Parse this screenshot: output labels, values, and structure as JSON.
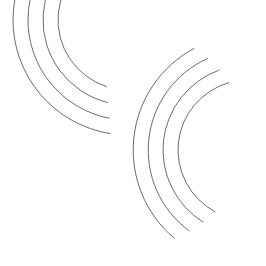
{
  "figure": {
    "width": 266,
    "height": 266,
    "background_color": "#ffffff",
    "stroke_color": "#5a5a5a",
    "stroke_width": 0.9
  },
  "chart_data": {
    "type": "line",
    "subtitle": "",
    "xlabel": "",
    "ylabel": "",
    "xlim": [
      0,
      266
    ],
    "ylim": [
      0,
      266
    ],
    "grid": false,
    "legend": "none",
    "annotations": [],
    "series": [
      {
        "name": "upper-left-arc-1",
        "family": "upper-left",
        "center": [
          128,
          20
        ],
        "radius": 70,
        "start_angle_deg": 108,
        "end_angle_deg": 262,
        "sweep": "clockwise"
      },
      {
        "name": "upper-left-arc-2",
        "family": "upper-left",
        "center": [
          128,
          20
        ],
        "radius": 85,
        "start_angle_deg": 104,
        "end_angle_deg": 262,
        "sweep": "clockwise"
      },
      {
        "name": "upper-left-arc-3",
        "family": "upper-left",
        "center": [
          128,
          20
        ],
        "radius": 100,
        "start_angle_deg": 101,
        "end_angle_deg": 262,
        "sweep": "clockwise"
      },
      {
        "name": "upper-left-arc-4",
        "family": "upper-left",
        "center": [
          128,
          20
        ],
        "radius": 115,
        "start_angle_deg": 99,
        "end_angle_deg": 262,
        "sweep": "clockwise"
      },
      {
        "name": "lower-right-arc-1",
        "family": "lower-right",
        "center": [
          248,
          150
        ],
        "radius": 70,
        "start_angle_deg": 118,
        "end_angle_deg": 254,
        "sweep": "clockwise"
      },
      {
        "name": "lower-right-arc-2",
        "family": "lower-right",
        "center": [
          248,
          150
        ],
        "radius": 85,
        "start_angle_deg": 122,
        "end_angle_deg": 250,
        "sweep": "clockwise"
      },
      {
        "name": "lower-right-arc-3",
        "family": "lower-right",
        "center": [
          248,
          150
        ],
        "radius": 100,
        "start_angle_deg": 126,
        "end_angle_deg": 246,
        "sweep": "clockwise"
      },
      {
        "name": "lower-right-arc-4",
        "family": "lower-right",
        "center": [
          248,
          150
        ],
        "radius": 115,
        "start_angle_deg": 130,
        "end_angle_deg": 242,
        "sweep": "clockwise"
      }
    ]
  }
}
